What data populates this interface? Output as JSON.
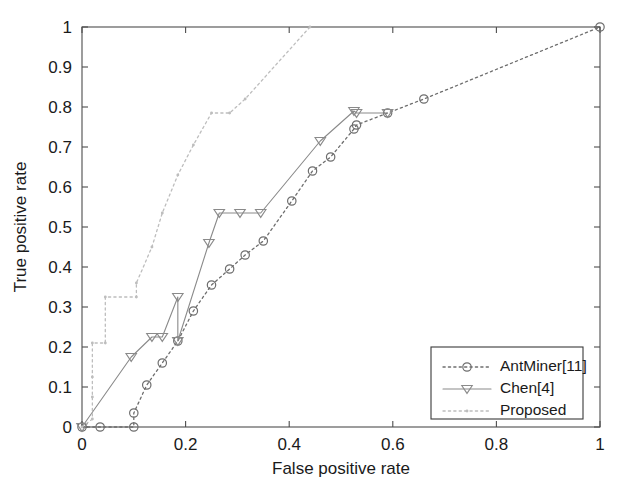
{
  "chart_data": {
    "type": "line",
    "title": "",
    "xlabel": "False positive rate",
    "ylabel": "True positive rate",
    "xlim": [
      0,
      1
    ],
    "ylim": [
      0,
      1
    ],
    "grid": false,
    "legend_position": "lower-right",
    "xticks": [
      "0",
      "0.2",
      "0.4",
      "0.6",
      "0.8",
      "1"
    ],
    "xtick_values": [
      0,
      0.2,
      0.4,
      0.6,
      0.8,
      1
    ],
    "yticks": [
      "0",
      "0.1",
      "0.2",
      "0.3",
      "0.4",
      "0.5",
      "0.6",
      "0.7",
      "0.8",
      "0.9",
      "1"
    ],
    "ytick_values": [
      0,
      0.1,
      0.2,
      0.3,
      0.4,
      0.5,
      0.6,
      0.7,
      0.8,
      0.9,
      1
    ],
    "series": [
      {
        "name": "AntMiner[11]",
        "style": "dotted",
        "marker": "circle",
        "color": "#6e6e6e",
        "x": [
          0,
          0.035,
          0.1,
          0.1,
          0.125,
          0.155,
          0.185,
          0.215,
          0.25,
          0.285,
          0.315,
          0.35,
          0.405,
          0.445,
          0.48,
          0.525,
          0.53,
          0.59,
          0.66,
          1.0
        ],
        "y": [
          0,
          0,
          0,
          0.035,
          0.105,
          0.16,
          0.215,
          0.29,
          0.355,
          0.395,
          0.43,
          0.465,
          0.565,
          0.64,
          0.675,
          0.745,
          0.755,
          0.785,
          0.82,
          1.0
        ]
      },
      {
        "name": "Chen[4]",
        "style": "solid",
        "marker": "triangle-down",
        "color": "#8a8a8a",
        "x": [
          0,
          0.095,
          0.135,
          0.155,
          0.185,
          0.185,
          0.245,
          0.265,
          0.305,
          0.345,
          0.46,
          0.525,
          0.53,
          0.59
        ],
        "y": [
          0,
          0.175,
          0.225,
          0.225,
          0.325,
          0.215,
          0.46,
          0.535,
          0.535,
          0.535,
          0.715,
          0.79,
          0.785,
          0.785
        ]
      },
      {
        "name": "Proposed",
        "style": "dotted",
        "marker": "star",
        "color": "#bdbdbd",
        "x": [
          0,
          0.02,
          0.02,
          0.02,
          0.02,
          0.045,
          0.045,
          0.105,
          0.105,
          0.135,
          0.155,
          0.185,
          0.215,
          0.25,
          0.285,
          0.315,
          0.44
        ],
        "y": [
          0,
          0.02,
          0.075,
          0.125,
          0.21,
          0.21,
          0.325,
          0.325,
          0.36,
          0.45,
          0.535,
          0.63,
          0.705,
          0.785,
          0.785,
          0.82,
          1.0
        ]
      }
    ]
  },
  "legend": {
    "entries": [
      {
        "label": "AntMiner[11]"
      },
      {
        "label": "Chen[4]"
      },
      {
        "label": "Proposed"
      }
    ]
  }
}
